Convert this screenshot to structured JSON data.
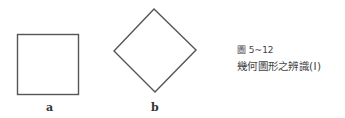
{
  "figure": {
    "number": "圖 5~12",
    "title": "幾何圖形之辨識(Ⅰ)",
    "shapes": [
      {
        "id": "a",
        "type": "square",
        "label": "a"
      },
      {
        "id": "b",
        "type": "diamond",
        "label": "b"
      }
    ],
    "stroke_color": "#555555"
  }
}
